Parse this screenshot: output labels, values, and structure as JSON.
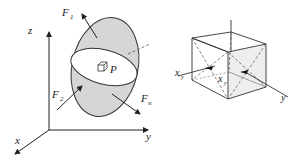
{
  "left_figure": {
    "axes": {
      "z": "z",
      "x": "x",
      "y": "y"
    },
    "forces": {
      "f1": "F",
      "f1_sub": "1",
      "f2": "F",
      "f2_sub": "2",
      "fn": "F",
      "fn_sub": "n"
    },
    "point": "P"
  },
  "right_figure": {
    "axes": {
      "x": "x",
      "x_sub": "y",
      "inner": "x",
      "inner_sub": "y",
      "y": "y"
    }
  },
  "colors": {
    "surface_fill": "#d6d6d6",
    "section_fill": "#ffffff",
    "stroke": "#333333"
  }
}
